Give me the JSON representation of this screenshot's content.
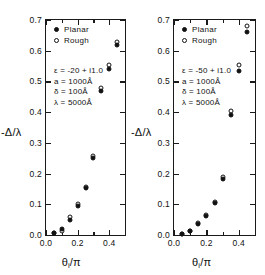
{
  "chart_data": [
    {
      "type": "scatter",
      "panel": "left",
      "title": "",
      "xlabel": "θᵢ / π",
      "ylabel": "-Δ/λ",
      "xlim": [
        0.0,
        0.5
      ],
      "ylim": [
        0.0,
        0.7
      ],
      "xticks": [
        0.0,
        0.2,
        0.4
      ],
      "xtick_labels": [
        "0.0",
        "0.2",
        "0.4"
      ],
      "xminor": [
        0.1,
        0.3,
        0.5
      ],
      "yticks": [
        0.0,
        0.1,
        0.2,
        0.3,
        0.4,
        0.5,
        0.6,
        0.7
      ],
      "ytick_labels": [
        "0.0",
        "0.1",
        "0.2",
        "0.3",
        "0.4",
        "0.5",
        "0.6",
        "0.7"
      ],
      "grid": false,
      "legend_position": "upper-left",
      "annotations": [
        "ε = -20 + i1.0",
        "a = 1000Å",
        "δ =  100Å",
        "λ = 5000Å"
      ],
      "series": [
        {
          "name": "Planar",
          "marker": "filled-circle",
          "x": [
            0.05,
            0.1,
            0.15,
            0.2,
            0.25,
            0.3,
            0.35,
            0.4,
            0.45
          ],
          "y": [
            0.005,
            0.018,
            0.05,
            0.095,
            0.152,
            0.252,
            0.47,
            0.54,
            0.62
          ]
        },
        {
          "name": "Rough",
          "marker": "open-circle",
          "x": [
            0.05,
            0.1,
            0.15,
            0.2,
            0.25,
            0.3,
            0.35,
            0.4,
            0.45
          ],
          "y": [
            0.005,
            0.014,
            0.058,
            0.1,
            0.157,
            0.258,
            0.478,
            0.552,
            0.628
          ]
        }
      ]
    },
    {
      "type": "scatter",
      "panel": "right",
      "title": "",
      "xlabel": "θᵢ / π",
      "ylabel": "-Δ/λ",
      "xlim": [
        0.0,
        0.5
      ],
      "ylim": [
        0.0,
        0.7
      ],
      "xticks": [
        0.0,
        0.2,
        0.4
      ],
      "xtick_labels": [
        "0.0",
        "0.2",
        "0.4"
      ],
      "xminor": [
        0.1,
        0.3,
        0.5
      ],
      "yticks": [
        0.0,
        0.1,
        0.2,
        0.3,
        0.4,
        0.5,
        0.6,
        0.7
      ],
      "ytick_labels": [
        "0.0",
        "0.1",
        "0.2",
        "0.3",
        "0.4",
        "0.5",
        "0.6",
        "0.7"
      ],
      "grid": false,
      "legend_position": "upper-left",
      "annotations": [
        "ε = -50 + i1.0",
        "a = 1000Å",
        "δ =  100Å",
        "λ = 5000Å"
      ],
      "series": [
        {
          "name": "Planar",
          "marker": "filled-circle",
          "x": [
            0.05,
            0.1,
            0.15,
            0.2,
            0.25,
            0.3,
            0.35,
            0.4,
            0.45
          ],
          "y": [
            0.004,
            0.012,
            0.035,
            0.062,
            0.103,
            0.182,
            0.39,
            0.535,
            0.66
          ]
        },
        {
          "name": "Rough",
          "marker": "open-circle",
          "x": [
            0.05,
            0.1,
            0.15,
            0.2,
            0.25,
            0.3,
            0.35,
            0.4,
            0.45
          ],
          "y": [
            0.004,
            0.012,
            0.04,
            0.066,
            0.108,
            0.188,
            0.405,
            0.555,
            0.68
          ]
        }
      ]
    }
  ],
  "legend": {
    "planar_label": "Planar",
    "rough_label": "Rough"
  },
  "axis": {
    "y_title_main": "-Δ/λ",
    "x_title_theta": "θ",
    "x_title_sub": "i",
    "x_title_rest": "/π"
  }
}
